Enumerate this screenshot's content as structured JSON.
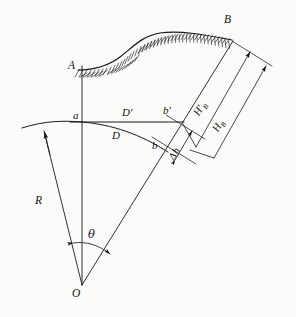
{
  "figure": {
    "type": "geodetic-refraction-diagram",
    "stroke_color": "#1a1a1a",
    "background_color": "#fbfbf9"
  },
  "points": {
    "A": "A",
    "B": "B",
    "O": "O",
    "a": "a",
    "b": "b",
    "b_prime": "b′"
  },
  "distances": {
    "D_prime": "D′",
    "D": "D"
  },
  "heights": {
    "H_B_prime": "H′",
    "H_B_prime_sub": "B",
    "H_B": "H",
    "H_B_sub": "B",
    "delta_h": "Δh"
  },
  "radius": {
    "label": "R"
  },
  "angle": {
    "label": "θ"
  },
  "geometry": {
    "O": [
      82,
      285
    ],
    "A": [
      82,
      68
    ],
    "B": [
      232,
      40
    ],
    "a": [
      82,
      122
    ],
    "b": [
      160,
      146
    ],
    "b_prime": [
      170,
      122
    ],
    "arc_left_start": [
      22,
      128
    ],
    "terrain_peak_y": 33
  }
}
